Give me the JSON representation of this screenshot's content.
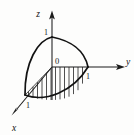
{
  "figure": {
    "kind": "math-3d-diagram",
    "background_color": "#fdfdfc",
    "ink_color": "#121212",
    "caption": "",
    "axes": [
      {
        "id": "z",
        "label": "z",
        "direction": "up",
        "tick_label": "1",
        "tick_value": 1,
        "arrow": true,
        "from": [
          52,
          67
        ],
        "to": [
          52,
          12
        ],
        "label_pos": [
          38,
          16
        ],
        "tick_label_pos": [
          45,
          33
        ]
      },
      {
        "id": "y",
        "label": "y",
        "direction": "right",
        "tick_label": "1",
        "tick_value": 1,
        "arrow": true,
        "from": [
          52,
          67
        ],
        "to": [
          124,
          67
        ],
        "label_pos": [
          127,
          65
        ],
        "tick_label_pos": [
          87,
          78
        ]
      },
      {
        "id": "x",
        "label": "x",
        "direction": "lower-left",
        "tick_label": "1",
        "tick_value": 1,
        "arrow": true,
        "from": [
          52,
          67
        ],
        "to": [
          12,
          114
        ],
        "label_pos": [
          13,
          130
        ],
        "tick_label_pos": [
          27,
          107
        ]
      }
    ],
    "origin": {
      "label": "0",
      "point": [
        52,
        67
      ],
      "label_pos": [
        56,
        64
      ]
    },
    "unit_points": {
      "z1": [
        52,
        37
      ],
      "y1": [
        88,
        67
      ],
      "x1": [
        25,
        95
      ]
    },
    "hatching": {
      "orientation": "vertical",
      "line_count": 12,
      "region": "base region in xy-plane"
    }
  }
}
